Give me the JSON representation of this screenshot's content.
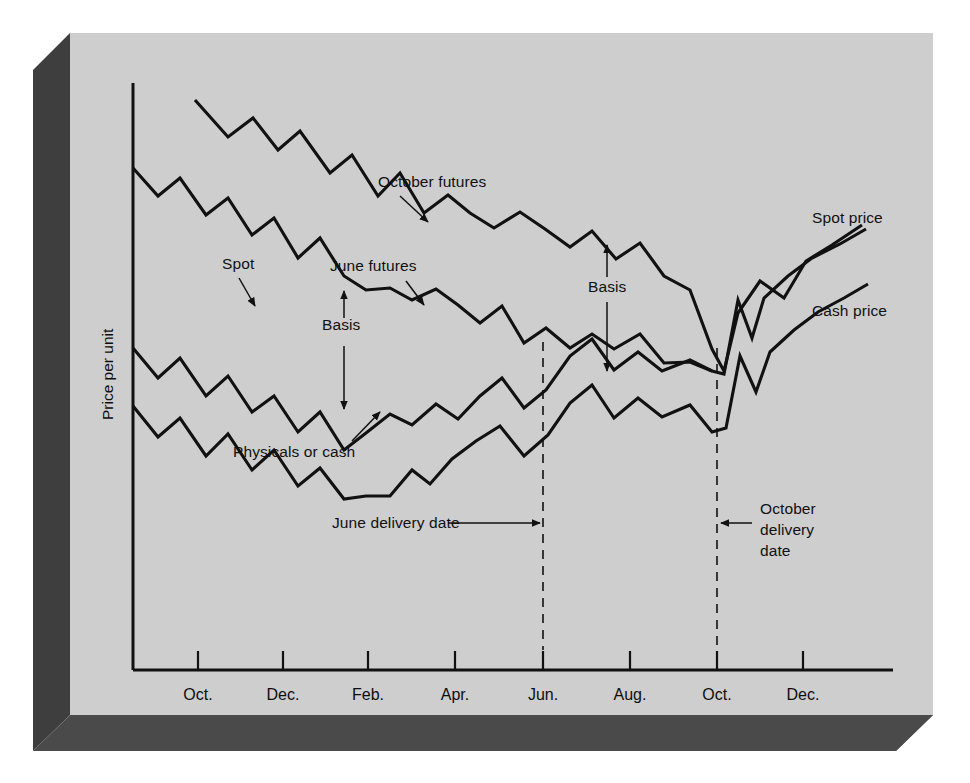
{
  "figure": {
    "background_color": "#ffffff",
    "panel_color": "#cfcfcf",
    "shadow_color": "#4a4a4a",
    "line_color": "#111111"
  },
  "chart_data": {
    "type": "line",
    "title": "",
    "xlabel": "",
    "ylabel": "Price per unit",
    "grid": false,
    "legend_position": "inline-annotations",
    "x_tick_labels": [
      "Oct.",
      "Dec.",
      "Feb.",
      "Apr.",
      "Jun.",
      "Aug.",
      "Oct.",
      "Dec."
    ],
    "x_tick_positions": [
      198,
      283,
      368,
      455,
      543,
      630,
      717,
      803
    ],
    "y_axis_ticks": [],
    "axis_ranges": {
      "x": [
        133,
        893
      ],
      "y_pixels": [
        83,
        670
      ]
    },
    "series": [
      {
        "name": "October futures",
        "label_text": "October futures",
        "points": [
          [
            195,
            100
          ],
          [
            228,
            137
          ],
          [
            253,
            118
          ],
          [
            278,
            150
          ],
          [
            300,
            131
          ],
          [
            330,
            173
          ],
          [
            352,
            155
          ],
          [
            378,
            196
          ],
          [
            400,
            173
          ],
          [
            424,
            213
          ],
          [
            448,
            195
          ],
          [
            470,
            213
          ],
          [
            494,
            228
          ],
          [
            520,
            212
          ],
          [
            545,
            229
          ],
          [
            570,
            247
          ],
          [
            592,
            231
          ],
          [
            616,
            259
          ],
          [
            640,
            243
          ],
          [
            664,
            276
          ],
          [
            690,
            290
          ],
          [
            712,
            349
          ],
          [
            724,
            371
          ],
          [
            738,
            313
          ],
          [
            760,
            281
          ],
          [
            784,
            298
          ],
          [
            806,
            261
          ],
          [
            832,
            245
          ],
          [
            862,
            225
          ]
        ]
      },
      {
        "name": "June futures",
        "label_text": "June futures",
        "points": [
          [
            133,
            168
          ],
          [
            158,
            196
          ],
          [
            180,
            178
          ],
          [
            206,
            215
          ],
          [
            228,
            198
          ],
          [
            252,
            235
          ],
          [
            274,
            218
          ],
          [
            298,
            258
          ],
          [
            320,
            238
          ],
          [
            344,
            276
          ],
          [
            366,
            290
          ],
          [
            390,
            288
          ],
          [
            412,
            300
          ],
          [
            436,
            289
          ],
          [
            458,
            305
          ],
          [
            480,
            323
          ],
          [
            502,
            306
          ],
          [
            524,
            343
          ],
          [
            546,
            328
          ],
          [
            570,
            348
          ],
          [
            592,
            334
          ],
          [
            614,
            349
          ],
          [
            640,
            334
          ],
          [
            664,
            363
          ],
          [
            690,
            362
          ],
          [
            712,
            371
          ]
        ]
      },
      {
        "name": "Spot / cash price",
        "label_text": "Spot price",
        "points": [
          [
            133,
            348
          ],
          [
            158,
            378
          ],
          [
            180,
            358
          ],
          [
            206,
            396
          ],
          [
            228,
            376
          ],
          [
            252,
            412
          ],
          [
            274,
            396
          ],
          [
            298,
            432
          ],
          [
            320,
            412
          ],
          [
            344,
            450
          ],
          [
            366,
            433
          ],
          [
            390,
            414
          ],
          [
            412,
            425
          ],
          [
            436,
            404
          ],
          [
            458,
            419
          ],
          [
            480,
            396
          ],
          [
            502,
            378
          ],
          [
            524,
            408
          ],
          [
            546,
            390
          ],
          [
            570,
            356
          ],
          [
            592,
            339
          ],
          [
            614,
            370
          ],
          [
            638,
            352
          ],
          [
            662,
            371
          ],
          [
            690,
            360
          ],
          [
            712,
            371
          ],
          [
            724,
            374
          ],
          [
            738,
            300
          ],
          [
            752,
            338
          ],
          [
            764,
            298
          ],
          [
            788,
            276
          ],
          [
            812,
            258
          ],
          [
            840,
            244
          ],
          [
            866,
            229
          ]
        ]
      },
      {
        "name": "Physicals or cash",
        "label_text": "Cash price",
        "points": [
          [
            133,
            406
          ],
          [
            158,
            437
          ],
          [
            180,
            418
          ],
          [
            206,
            456
          ],
          [
            228,
            434
          ],
          [
            252,
            470
          ],
          [
            274,
            450
          ],
          [
            298,
            486
          ],
          [
            320,
            468
          ],
          [
            344,
            499
          ],
          [
            366,
            496
          ],
          [
            390,
            496
          ],
          [
            412,
            470
          ],
          [
            430,
            484
          ],
          [
            452,
            459
          ],
          [
            476,
            441
          ],
          [
            500,
            426
          ],
          [
            524,
            456
          ],
          [
            548,
            435
          ],
          [
            570,
            403
          ],
          [
            592,
            385
          ],
          [
            614,
            418
          ],
          [
            638,
            398
          ],
          [
            662,
            417
          ],
          [
            690,
            405
          ],
          [
            712,
            432
          ],
          [
            726,
            428
          ],
          [
            740,
            356
          ],
          [
            756,
            392
          ],
          [
            770,
            352
          ],
          [
            794,
            330
          ],
          [
            818,
            312
          ],
          [
            844,
            298
          ],
          [
            868,
            284
          ]
        ]
      }
    ],
    "annotations": [
      {
        "name": "october-futures-label",
        "text": "October futures",
        "x": 378,
        "y": 187
      },
      {
        "name": "spot-label",
        "text": "Spot",
        "x": 222,
        "y": 269
      },
      {
        "name": "june-futures-label",
        "text": "June futures",
        "x": 330,
        "y": 271
      },
      {
        "name": "basis-left-label",
        "text": "Basis",
        "x": 322,
        "y": 330
      },
      {
        "name": "basis-right-label",
        "text": "Basis",
        "x": 588,
        "y": 292
      },
      {
        "name": "physicals-or-cash-label",
        "text": "Physicals or cash",
        "x": 233,
        "y": 457
      },
      {
        "name": "spot-price-label",
        "text": "Spot price",
        "x": 812,
        "y": 223
      },
      {
        "name": "cash-price-label",
        "text": "Cash price",
        "x": 812,
        "y": 316
      },
      {
        "name": "june-delivery-date-label",
        "text": "June delivery date",
        "x": 332,
        "y": 528
      },
      {
        "name": "october-delivery-date-label-line1",
        "text": "October",
        "x": 760,
        "y": 514
      },
      {
        "name": "october-delivery-date-label-line2",
        "text": "delivery",
        "x": 760,
        "y": 535
      },
      {
        "name": "october-delivery-date-label-line3",
        "text": "date",
        "x": 760,
        "y": 556
      }
    ],
    "delivery_markers": [
      {
        "name": "june-delivery-marker",
        "label": "June delivery date",
        "x": 543,
        "y_top": 342,
        "y_bottom": 650
      },
      {
        "name": "october-delivery-marker",
        "label": "October delivery date",
        "x": 717,
        "y_top": 348,
        "y_bottom": 650
      }
    ]
  }
}
